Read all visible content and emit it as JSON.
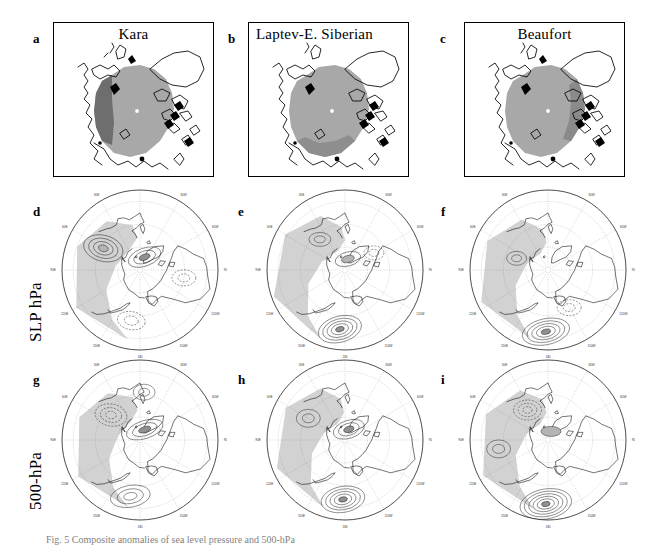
{
  "figure": {
    "row_labels": [
      {
        "id": "slp",
        "text": "SLP hPa"
      },
      {
        "id": "z500",
        "text": "500-hPa"
      }
    ],
    "caption": "Fig. 5 Composite anomalies of sea level pressure and 500-hPa"
  },
  "panels": {
    "a": {
      "letter": "a",
      "title": "Kara",
      "title_align": "center"
    },
    "b": {
      "letter": "b",
      "title": "Laptev-E. Siberian",
      "title_align": "left"
    },
    "c": {
      "letter": "c",
      "title": "Beaufort",
      "title_align": "center"
    },
    "d": {
      "letter": "d",
      "title": ""
    },
    "e": {
      "letter": "e",
      "title": ""
    },
    "f": {
      "letter": "f",
      "title": ""
    },
    "g": {
      "letter": "g",
      "title": ""
    },
    "h": {
      "letter": "h",
      "title": ""
    },
    "i": {
      "letter": "i",
      "title": ""
    }
  },
  "longitude_labels": [
    "30E",
    "60E",
    "90E",
    "120E",
    "150E",
    "180",
    "150W",
    "120W",
    "90W",
    "60W",
    "30W",
    "0"
  ],
  "colors": {
    "ice_extent_gray": "#a8a8a8",
    "ice_anomaly_gray": "#6e6e6e",
    "shade_light": "#d2d2d2",
    "shade_mid": "#b4b4b4",
    "shade_dark": "#909090",
    "coastline": "#000000",
    "contour": "#1a1a1a",
    "grid": "#808080",
    "box_border": "#000000",
    "background": "#ffffff"
  },
  "chart_data": {
    "type": "map",
    "projection": "polar stereographic (Northern Hemisphere)",
    "grid": true,
    "legend": "none",
    "rows": [
      {
        "id": "ice",
        "label": "",
        "variable": "Arctic sea-ice extent / anomaly region",
        "map_style": "boxed rectangular Arctic map"
      },
      {
        "id": "slp",
        "label": "SLP hPa",
        "variable": "Sea level pressure anomaly",
        "units": "hPa",
        "map_style": "polar stereographic"
      },
      {
        "id": "z500",
        "label": "500-hPa",
        "variable": "500-hPa geopotential height anomaly",
        "units": "m",
        "map_style": "polar stereographic"
      }
    ],
    "columns": [
      {
        "id": "kara",
        "label": "Kara"
      },
      {
        "id": "laptev",
        "label": "Laptev-E. Siberian"
      },
      {
        "id": "beaufort",
        "label": "Beaufort"
      }
    ],
    "panels": [
      {
        "letter": "a",
        "row": "ice",
        "column": "kara",
        "anomaly_region": "Kara Sea sector (western Arctic-Atlantic side)"
      },
      {
        "letter": "b",
        "row": "ice",
        "column": "laptev",
        "anomaly_region": "Laptev and East Siberian Sea sector"
      },
      {
        "letter": "c",
        "row": "ice",
        "column": "beaufort",
        "anomaly_region": "Beaufort Sea sector (Canadian side)"
      },
      {
        "letter": "d",
        "row": "slp",
        "column": "kara",
        "features": "positive SLP anomaly centre over North Atlantic / Greenland; weak negative over central Arctic"
      },
      {
        "letter": "e",
        "row": "slp",
        "column": "laptev",
        "features": "strong negative SLP anomaly centre over North Pacific near 180; positive over Eurasia"
      },
      {
        "letter": "f",
        "row": "slp",
        "column": "beaufort",
        "features": "deep negative SLP anomaly centre over the North Pacific"
      },
      {
        "letter": "g",
        "row": "z500",
        "column": "kara",
        "features": "positive 500-hPa height anomaly near Greenland / 30W"
      },
      {
        "letter": "h",
        "row": "z500",
        "column": "laptev",
        "features": "positive anomaly over Greenland, negative anomaly over North Pacific"
      },
      {
        "letter": "i",
        "row": "z500",
        "column": "beaufort",
        "features": "broad negative 500-hPa anomaly over the North Pacific sector"
      }
    ],
    "contour_shading": {
      "light": "weak anomaly",
      "mid": "moderate anomaly",
      "dark": "strong anomaly centre"
    }
  }
}
